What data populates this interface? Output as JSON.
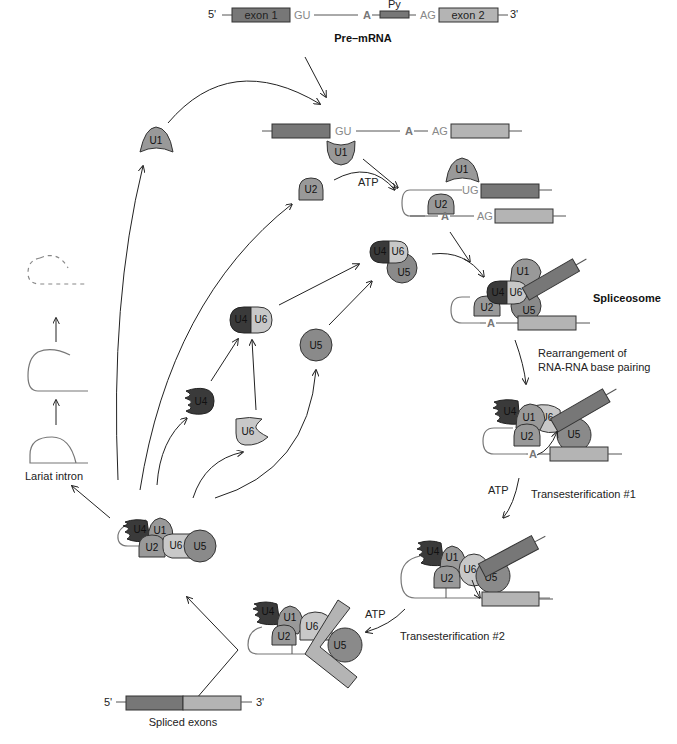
{
  "figure": {
    "colors": {
      "exon1": "#777777",
      "exon2": "#b4b4b4",
      "U1": "#999999",
      "U2": "#999999",
      "U4": "#3a3a3a",
      "U5": "#8a8a8a",
      "U6": "#c8c8c8",
      "arrow": "#222222"
    }
  },
  "pre_mrna": {
    "five_prime": "5'",
    "exon1": "exon 1",
    "gu": "GU",
    "branch_a": "A",
    "py": "Py",
    "ag": "AG",
    "exon2": "exon 2",
    "three_prime": "3'",
    "caption": "Pre–mRNA"
  },
  "snrnps": {
    "u1": "U1",
    "u2": "U2",
    "u4": "U4",
    "u5": "U5",
    "u6": "U6"
  },
  "sequence_labels": {
    "gu": "GU",
    "ug": "UG",
    "a": "A",
    "ag": "AG"
  },
  "steps": {
    "atp1": "ATP",
    "spliceosome": "Spliceosome",
    "rearrangement_line1": "Rearrangement of",
    "rearrangement_line2": "RNA-RNA base pairing",
    "atp2": "ATP",
    "transesterification1": "Transesterification #1",
    "atp3": "ATP",
    "transesterification2": "Transesterification #2"
  },
  "products": {
    "lariat_intron": "Lariat intron",
    "spliced_exons": "Spliced exons",
    "five_prime": "5'",
    "three_prime": "3'"
  }
}
